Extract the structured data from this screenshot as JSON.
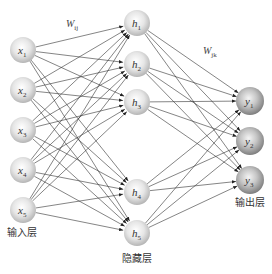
{
  "diagram": {
    "type": "neural-network",
    "layers": [
      {
        "name": "input",
        "label": "输入层",
        "nodes": [
          {
            "id": "x1",
            "base": "x",
            "sub": "1",
            "cx": 23,
            "cy": 50
          },
          {
            "id": "x2",
            "base": "x",
            "sub": "2",
            "cx": 23,
            "cy": 90
          },
          {
            "id": "x3",
            "base": "x",
            "sub": "3",
            "cx": 23,
            "cy": 130
          },
          {
            "id": "x4",
            "base": "x",
            "sub": "4",
            "cx": 23,
            "cy": 170
          },
          {
            "id": "x5",
            "base": "x",
            "sub": "5",
            "cx": 23,
            "cy": 210
          }
        ],
        "label_pos": [
          22,
          236
        ]
      },
      {
        "name": "hidden",
        "label": "隐藏层",
        "nodes": [
          {
            "id": "h1",
            "base": "h",
            "sub": "1",
            "cx": 137,
            "cy": 23
          },
          {
            "id": "h2",
            "base": "h",
            "sub": "2",
            "cx": 137,
            "cy": 64
          },
          {
            "id": "h3",
            "base": "h",
            "sub": "3",
            "cx": 137,
            "cy": 102
          },
          {
            "id": "h4",
            "base": "h",
            "sub": "4",
            "cx": 137,
            "cy": 192
          },
          {
            "id": "h5",
            "base": "h",
            "sub": "5",
            "cx": 137,
            "cy": 233
          }
        ],
        "label_pos": [
          137,
          262
        ]
      },
      {
        "name": "output",
        "label": "输出层",
        "nodes": [
          {
            "id": "y1",
            "base": "y",
            "sub": "1",
            "cx": 250,
            "cy": 101
          },
          {
            "id": "y2",
            "base": "y",
            "sub": "2",
            "cx": 250,
            "cy": 141
          },
          {
            "id": "y3",
            "base": "y",
            "sub": "3",
            "cx": 250,
            "cy": 180
          }
        ],
        "label_pos": [
          250,
          206
        ]
      }
    ],
    "weights": [
      {
        "base": "W",
        "sub": "ij",
        "x": 66,
        "y": 27
      },
      {
        "base": "W",
        "sub": "jk",
        "x": 203,
        "y": 54
      }
    ],
    "colors": {
      "edge": "#333333",
      "node_light": "#f2f2f2",
      "node_mid": "#c8c8c8",
      "node_dark": "#9a9a9a"
    }
  }
}
